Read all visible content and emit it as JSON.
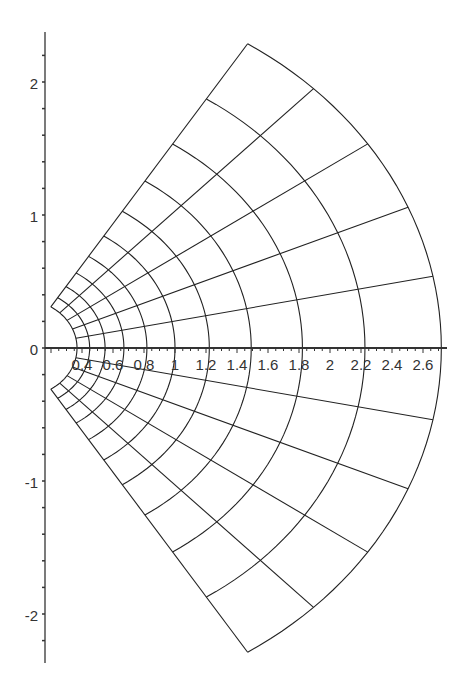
{
  "chart_data": {
    "type": "line",
    "title": "",
    "xlabel": "",
    "ylabel": "",
    "xlim": [
      0.16,
      2.75
    ],
    "ylim": [
      -2.4,
      2.37
    ],
    "grid": false,
    "legend": null,
    "x_tick_labels": [
      "0.4",
      "0.6",
      "0.8",
      "1",
      "1.2",
      "1.4",
      "1.6",
      "1.8",
      "2",
      "2.2",
      "2.4",
      "2.6"
    ],
    "x_ticks": [
      0.4,
      0.6,
      0.8,
      1,
      1.2,
      1.4,
      1.6,
      1.8,
      2,
      2.2,
      2.4,
      2.6
    ],
    "y_tick_labels": [
      "2",
      "1",
      "0",
      "-1",
      "-2"
    ],
    "y_ticks": [
      2,
      1,
      0,
      -1,
      -2
    ],
    "arc_radii": [
      0.368,
      0.449,
      0.549,
      0.67,
      0.819,
      1.0,
      1.221,
      1.492,
      1.822,
      2.226,
      2.718
    ],
    "radial_angles_rad": [
      -1.0,
      -0.8,
      -0.6,
      -0.4,
      -0.2,
      0.0,
      0.2,
      0.4,
      0.6,
      0.8,
      1.0
    ],
    "series": [
      {
        "name": "arcs r = e^u, u = -1..1 step 0.2",
        "u_values": [
          -1,
          -0.8,
          -0.6,
          -0.4,
          -0.2,
          0,
          0.2,
          0.4,
          0.6,
          0.8,
          1
        ]
      },
      {
        "name": "rays theta = v, v = -1..1 step 0.2",
        "v_values": [
          -1,
          -0.8,
          -0.6,
          -0.4,
          -0.2,
          0,
          0.2,
          0.4,
          0.6,
          0.8,
          1
        ]
      }
    ],
    "colors": {
      "line": "#222222",
      "axis": "#333333",
      "background": "#ffffff"
    }
  }
}
